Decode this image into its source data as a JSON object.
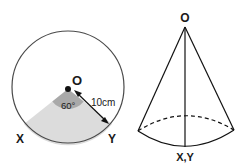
{
  "circle_figure": {
    "center_label": "O",
    "angle_label": "60°",
    "radius_label": "10cm",
    "point_left_label": "X",
    "point_right_label": "Y",
    "colors": {
      "outline": "#4a4a4a",
      "sector_fill": "#dcdcdc",
      "angle_fill": "#a9a9a9"
    }
  },
  "cone_figure": {
    "apex_label": "O",
    "base_label": "X,Y"
  }
}
